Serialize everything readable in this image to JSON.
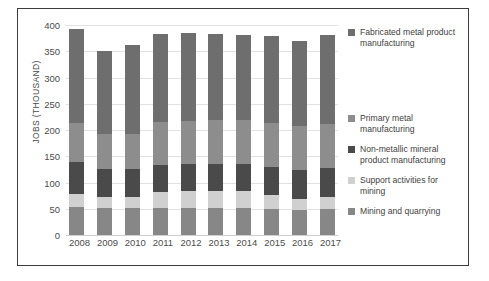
{
  "chart_data": {
    "type": "bar",
    "stacked": true,
    "title": "",
    "xlabel": "",
    "ylabel": "JOBS (THOUSAND)",
    "ylim": [
      0,
      400
    ],
    "ytick_step": 50,
    "yticks": [
      "400",
      "350",
      "300",
      "250",
      "200",
      "150",
      "100",
      "50",
      "0"
    ],
    "grid": true,
    "legend_position": "right",
    "categories": [
      "2008",
      "2009",
      "2010",
      "2011",
      "2012",
      "2013",
      "2014",
      "2015",
      "2016",
      "2017"
    ],
    "series": [
      {
        "name": "Mining and quarrying",
        "color": "#878787",
        "values": [
          54,
          52,
          52,
          52,
          52,
          52,
          51,
          50,
          48,
          49
        ]
      },
      {
        "name": "Support activities for mining",
        "color": "#d0d0d0",
        "values": [
          24,
          20,
          21,
          30,
          31,
          32,
          32,
          26,
          21,
          23
        ]
      },
      {
        "name": "Non-metallic mineral product manufacturing",
        "color": "#4a4a4a",
        "values": [
          61,
          53,
          53,
          51,
          52,
          52,
          53,
          54,
          54,
          55
        ]
      },
      {
        "name": "Primary metal manufacturing",
        "color": "#8d8d8d",
        "values": [
          74,
          67,
          67,
          82,
          83,
          83,
          83,
          84,
          84,
          85
        ]
      },
      {
        "name": "Fabricated metal product manufacturing",
        "color": "#6e6e6e",
        "values": [
          180,
          158,
          169,
          168,
          167,
          164,
          163,
          165,
          162,
          169
        ]
      }
    ],
    "totals": [
      393,
      350,
      362,
      383,
      385,
      383,
      382,
      379,
      369,
      381
    ]
  },
  "legend": {
    "items": [
      {
        "label": "Fabricated metal product manufacturing",
        "color": "#6e6e6e",
        "top": 2
      },
      {
        "label": "Primary metal manufacturing",
        "color": "#8d8d8d",
        "top": 88
      },
      {
        "label": "Non-metallic mineral product manufacturing",
        "color": "#4a4a4a",
        "top": 119
      },
      {
        "label": "Support activities for mining",
        "color": "#d0d0d0",
        "top": 150
      },
      {
        "label": "Mining and quarrying",
        "color": "#878787",
        "top": 181
      }
    ]
  }
}
